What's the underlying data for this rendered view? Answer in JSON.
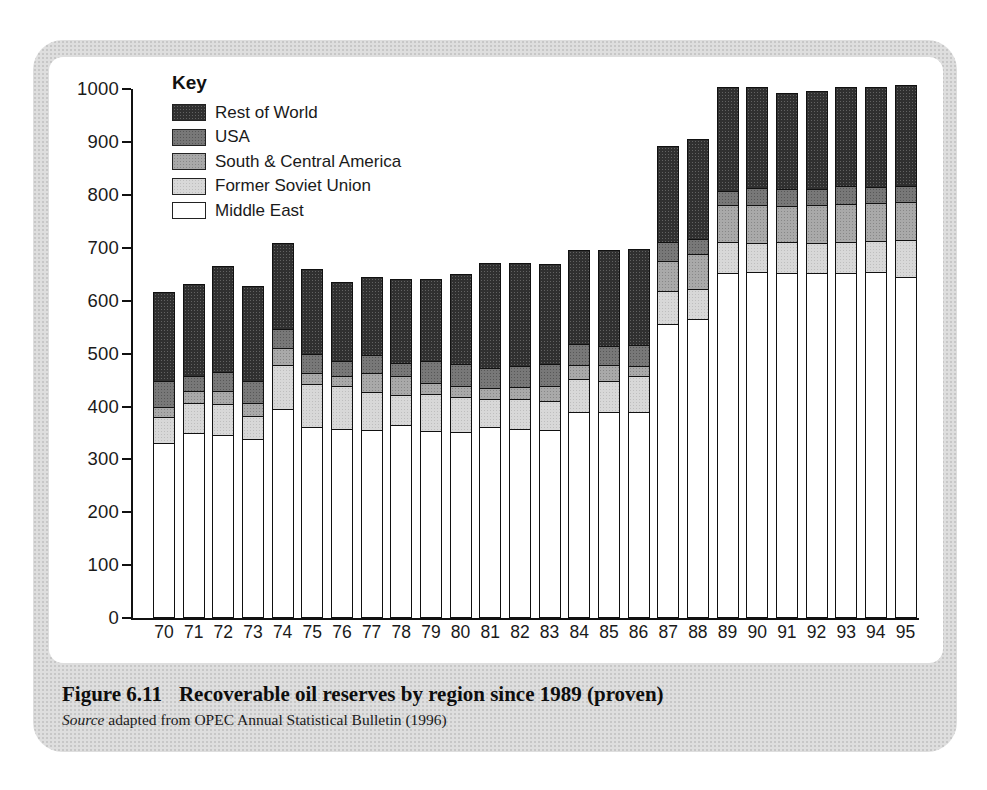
{
  "figure": {
    "caption_label": "Figure 6.11",
    "caption_title": "Recoverable oil reserves by region since 1989 (proven)",
    "source_word": "Source",
    "source_rest": " adapted from OPEC Annual Statistical Bulletin (1996)"
  },
  "legend": {
    "title": "Key",
    "order_top_to_bottom": [
      "Rest of World",
      "USA",
      "South & Central America",
      "Former Soviet Union",
      "Middle East"
    ]
  },
  "colors": {
    "rest_of_world": "#303030",
    "usa": "#787878",
    "south_central_america": "#a9a9a9",
    "former_soviet_union": "#d8d8d8",
    "middle_east": "#ffffff",
    "panel_background": "#dedede"
  },
  "chart_data": {
    "type": "bar",
    "stacked": true,
    "title": "",
    "xlabel": "",
    "ylabel": "",
    "ylim": [
      0,
      1000
    ],
    "yticks": [
      0,
      100,
      200,
      300,
      400,
      500,
      600,
      700,
      800,
      900,
      1000
    ],
    "grid": false,
    "legend_position": "top-left-inside",
    "categories": [
      "70",
      "71",
      "72",
      "73",
      "74",
      "75",
      "76",
      "77",
      "78",
      "79",
      "80",
      "81",
      "82",
      "83",
      "84",
      "85",
      "86",
      "87",
      "88",
      "89",
      "90",
      "91",
      "92",
      "93",
      "94",
      "95"
    ],
    "series": [
      {
        "name": "Middle East",
        "pattern": "white",
        "values": [
          330,
          349,
          344,
          337,
          393,
          359,
          356,
          353,
          363,
          352,
          350,
          360,
          356,
          353,
          388,
          388,
          388,
          554,
          564,
          651,
          654,
          652,
          651,
          651,
          653,
          643
        ]
      },
      {
        "name": "Former Soviet Union",
        "pattern": "light",
        "values": [
          49,
          56,
          59,
          43,
          84,
          82,
          81,
          73,
          57,
          70,
          66,
          52,
          57,
          57,
          62,
          59,
          68,
          63,
          58,
          59,
          55,
          58,
          58,
          59,
          59,
          71
        ]
      },
      {
        "name": "South & Central America",
        "pattern": "medium",
        "values": [
          18,
          23,
          25,
          25,
          33,
          22,
          19,
          36,
          36,
          22,
          22,
          22,
          22,
          28,
          27,
          30,
          19,
          57,
          65,
          70,
          72,
          68,
          71,
          73,
          72,
          72
        ]
      },
      {
        "name": "USA",
        "pattern": "dark",
        "values": [
          50,
          29,
          36,
          42,
          35,
          35,
          30,
          34,
          26,
          41,
          41,
          37,
          41,
          41,
          40,
          36,
          41,
          36,
          30,
          27,
          32,
          33,
          31,
          33,
          31,
          30
        ]
      },
      {
        "name": "Rest of World",
        "pattern": "black",
        "values": [
          170,
          174,
          202,
          181,
          164,
          162,
          150,
          150,
          160,
          156,
          171,
          201,
          195,
          191,
          180,
          184,
          183,
          182,
          190,
          197,
          192,
          183,
          186,
          189,
          190,
          192
        ]
      }
    ],
    "totals": [
      617,
      631,
      666,
      628,
      709,
      660,
      636,
      646,
      642,
      641,
      650,
      672,
      671,
      670,
      697,
      697,
      699,
      892,
      907,
      1004,
      1005,
      994,
      997,
      1005,
      1005,
      1008
    ]
  }
}
